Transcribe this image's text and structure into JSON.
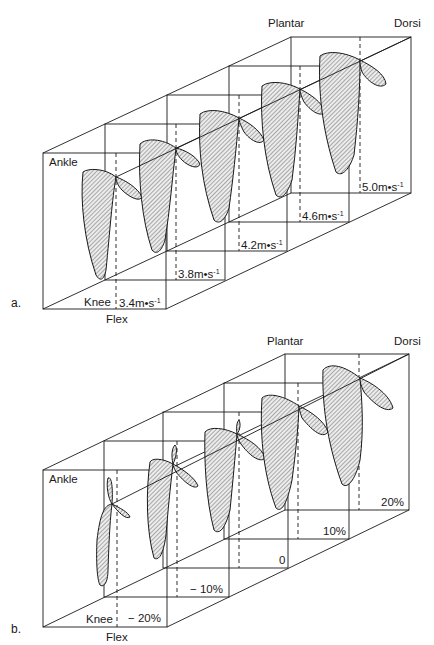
{
  "figure": {
    "panels": [
      {
        "id": "a",
        "letter": "a.",
        "axis_labels": {
          "ankle": "Ankle",
          "knee": "Knee",
          "flex": "Flex",
          "plantar": "Plantar",
          "dorsi": "Dorsi"
        },
        "condition_labels": [
          "3.4m•s",
          "3.8m•s",
          "4.2m•s",
          "4.6m•s",
          "5.0m•s"
        ],
        "condition_unit_exponent": "-1",
        "condition_variable": "running speed"
      },
      {
        "id": "b",
        "letter": "b.",
        "axis_labels": {
          "ankle": "Ankle",
          "knee": "Knee",
          "flex": "Flex",
          "plantar": "Plantar",
          "dorsi": "Dorsi"
        },
        "condition_labels": [
          "− 20%",
          "− 10%",
          "0",
          "10%",
          "20%"
        ],
        "condition_variable": "grade"
      }
    ],
    "colors": {
      "line": "#1a1a1a",
      "hatch": "#555555",
      "fill": "#e8e8e8",
      "background": "#ffffff"
    }
  }
}
